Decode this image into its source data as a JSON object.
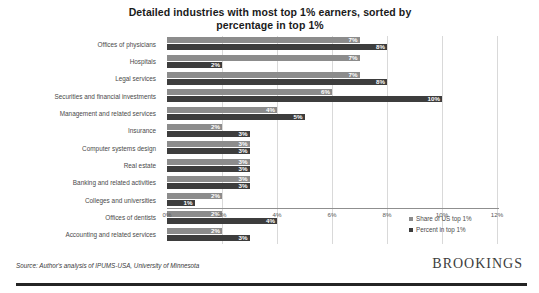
{
  "chart_data": {
    "type": "bar",
    "orientation": "horizontal",
    "title": "Detailed industries with most top 1% earners, sorted by percentage in top 1%",
    "title_line1": "Detailed industries with most top 1% earners, sorted by",
    "title_line2": "percentage in top 1%",
    "xlabel": "",
    "ylabel": "",
    "xlim": [
      0,
      12
    ],
    "xticks": [
      "0%",
      "2%",
      "4%",
      "6%",
      "8%",
      "10%",
      "12%"
    ],
    "xtick_values": [
      0,
      2,
      4,
      6,
      8,
      10,
      12
    ],
    "grid": true,
    "legend_position": "right-bottom",
    "categories": [
      "Offices of physicians",
      "Hospitals",
      "Legal services",
      "Securities and financial investments",
      "Management and related services",
      "Insurance",
      "Computer systems design",
      "Real estate",
      "Banking and related activities",
      "Colleges and universities",
      "Offices of dentists",
      "Accounting and related services"
    ],
    "series": [
      {
        "name": "Share of US top 1%",
        "color": "#8c8c8c",
        "values": [
          7,
          7,
          7,
          6,
          4,
          2,
          3,
          3,
          3,
          2,
          2,
          2
        ],
        "labels": [
          "7%",
          "7%",
          "7%",
          "6%",
          "4%",
          "2%",
          "3%",
          "3%",
          "3%",
          "2%",
          "2%",
          "2%"
        ]
      },
      {
        "name": "Percent in top 1%",
        "color": "#3d3d3d",
        "values": [
          8,
          2,
          8,
          10,
          5,
          3,
          3,
          3,
          3,
          1,
          4,
          3
        ],
        "labels": [
          "8%",
          "2%",
          "8%",
          "10%",
          "5%",
          "3%",
          "3%",
          "3%",
          "3%",
          "1%",
          "4%",
          "3%"
        ]
      }
    ]
  },
  "footer": {
    "source": "Source: Author's analysis of IPUMS-USA, University of Minnesota",
    "logo": "BROOKINGS"
  }
}
